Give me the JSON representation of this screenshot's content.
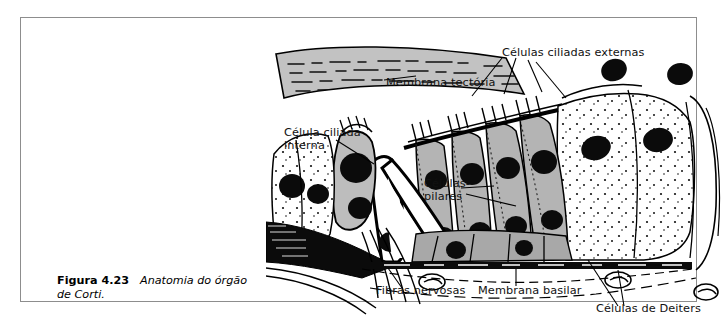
{
  "figure": {
    "caption_number": "Figura 4.23",
    "caption_text": "Anatomia do órgão de Corti.",
    "border_color": "#8d8d8d",
    "background": "#ffffff"
  },
  "diagram": {
    "title": "Anatomia do órgão de Corti",
    "ink_color": "#000000",
    "tissue_fill": "#b4b4b4",
    "labels": [
      {
        "id": "membrana-tectoria",
        "text": "Membrana tectória",
        "x": 120,
        "y": 47
      },
      {
        "id": "celulas-ciliadas-externas",
        "text": "Células ciliadas externas",
        "x": 236,
        "y": 17
      },
      {
        "id": "celula-ciliada-interna",
        "text": "Célula ciliada\ninterna",
        "x": 18,
        "y": 97
      },
      {
        "id": "celulas-pilares",
        "text": "Células-\npilares",
        "x": 158,
        "y": 148
      },
      {
        "id": "fibras-nervosas",
        "text": "Fibras nervosas",
        "x": 110,
        "y": 255
      },
      {
        "id": "membrana-basilar",
        "text": "Membrana basilar",
        "x": 212,
        "y": 255
      },
      {
        "id": "celulas-de-deiters",
        "text": "Células de Deiters",
        "x": 330,
        "y": 273
      }
    ],
    "structures": [
      "membrana-tectoria",
      "celula-ciliada-interna",
      "celulas-pilares",
      "tunel-de-corti",
      "celulas-ciliadas-externas",
      "celulas-de-deiters",
      "membrana-basilar",
      "fibras-nervosas"
    ]
  }
}
